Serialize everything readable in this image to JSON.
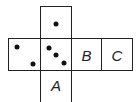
{
  "diagram": {
    "type": "cube-net",
    "faces": [
      {
        "id": "top",
        "label": "",
        "dots": 1
      },
      {
        "id": "left",
        "label": "",
        "dots": 2
      },
      {
        "id": "center",
        "label": "",
        "dots": 3
      },
      {
        "id": "B",
        "label": "B",
        "dots": 0
      },
      {
        "id": "C",
        "label": "C",
        "dots": 0
      },
      {
        "id": "A",
        "label": "A",
        "dots": 0
      }
    ]
  }
}
